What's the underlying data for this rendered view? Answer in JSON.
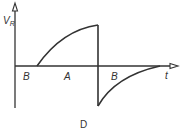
{
  "diagram": {
    "caption": "D",
    "y_axis_label_main": "V",
    "y_axis_label_sub": "R",
    "x_axis_label": "t",
    "regions": [
      {
        "label": "B",
        "x": 25
      },
      {
        "label": "A",
        "x": 66
      },
      {
        "label": "B",
        "x": 114
      }
    ],
    "colors": {
      "stroke": "#333333",
      "background": "#ffffff"
    }
  }
}
